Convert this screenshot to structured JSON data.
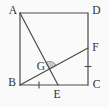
{
  "figure": {
    "canvas": {
      "width": 109,
      "height": 107,
      "background": "#fafafa"
    },
    "style": {
      "line_color": "#4a4a4a",
      "line_width": 1.2,
      "tick_width": 1.1,
      "tick_length": 7,
      "label_color": "#2f2f2f",
      "label_font_size": 11.5,
      "angle_fill": "#cbcbcb",
      "angle_stroke": "#808080",
      "angle_radius": 7.5
    },
    "points": {
      "A": {
        "x": 20,
        "y": 13
      },
      "B": {
        "x": 20,
        "y": 85
      },
      "C": {
        "x": 88,
        "y": 85
      },
      "D": {
        "x": 88,
        "y": 13
      },
      "E": {
        "x": 58,
        "y": 85
      },
      "F": {
        "x": 88,
        "y": 48
      },
      "G": {
        "x": 49.5,
        "y": 68.9
      }
    },
    "segments": [
      {
        "name": "side-AD",
        "from": "A",
        "to": "D"
      },
      {
        "name": "side-DC",
        "from": "D",
        "to": "C"
      },
      {
        "name": "side-CB",
        "from": "C",
        "to": "B"
      },
      {
        "name": "side-BA",
        "from": "B",
        "to": "A"
      },
      {
        "name": "cevian-AE",
        "from": "A",
        "to": "E"
      },
      {
        "name": "cevian-BF",
        "from": "B",
        "to": "F"
      }
    ],
    "ticks": [
      {
        "name": "tick-BE",
        "x": 39,
        "y": 85,
        "orientation": "vertical"
      },
      {
        "name": "tick-FC",
        "x": 88,
        "y": 66.5,
        "orientation": "horizontal"
      }
    ],
    "angle_marker": {
      "name": "angle-AGF",
      "vertex": "G",
      "ray1": "A",
      "ray2": "F"
    },
    "labels": [
      {
        "name": "label-A",
        "text": "A",
        "x": 13,
        "y": 14
      },
      {
        "name": "label-D",
        "text": "D",
        "x": 96.5,
        "y": 14
      },
      {
        "name": "label-B",
        "text": "B",
        "x": 12,
        "y": 86
      },
      {
        "name": "label-C",
        "text": "C",
        "x": 96.5,
        "y": 88
      },
      {
        "name": "label-E",
        "text": "E",
        "x": 57,
        "y": 98
      },
      {
        "name": "label-F",
        "text": "F",
        "x": 95.5,
        "y": 51
      },
      {
        "name": "label-G",
        "text": "G",
        "x": 41,
        "y": 70
      }
    ]
  }
}
